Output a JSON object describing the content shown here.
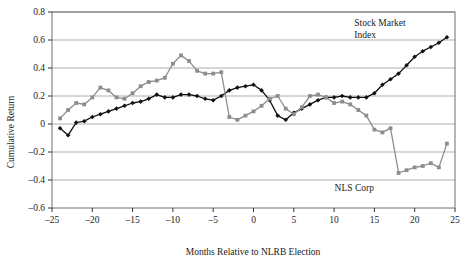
{
  "chart_data": {
    "type": "line",
    "title": "",
    "xlabel": "Months Relative to NLRB Election",
    "ylabel": "Cumulative Return",
    "xlim": [
      -25,
      25
    ],
    "ylim": [
      -0.6,
      0.8
    ],
    "xticks": [
      -25,
      -20,
      -15,
      -10,
      -5,
      0,
      5,
      10,
      15,
      20,
      25
    ],
    "xticklabels": [
      "–25",
      "–20",
      "–15",
      "–10",
      "–5",
      "0",
      "5",
      "10",
      "15",
      "20",
      "25"
    ],
    "yticks": [
      -0.6,
      -0.4,
      -0.2,
      0,
      0.2,
      0.4,
      0.6,
      0.8
    ],
    "yticklabels": [
      "–0.6",
      "–0.4",
      "–0.2",
      "0",
      "0.2",
      "0.4",
      "0.6",
      "0.8"
    ],
    "grid": "horizontal",
    "legend_position": "inline-annotation",
    "series": [
      {
        "name": "Stock Market Index",
        "color": "#111111",
        "marker": "filled-diamond",
        "label_x": 12.5,
        "label_y": 0.7,
        "x": [
          -24,
          -23,
          -22,
          -21,
          -20,
          -19,
          -18,
          -17,
          -16,
          -15,
          -14,
          -13,
          -12,
          -11,
          -10,
          -9,
          -8,
          -7,
          -6,
          -5,
          -4,
          -3,
          -2,
          -1,
          0,
          1,
          2,
          3,
          4,
          5,
          6,
          7,
          8,
          9,
          10,
          11,
          12,
          13,
          14,
          15,
          16,
          17,
          18,
          19,
          20,
          21,
          22,
          23,
          24
        ],
        "values": [
          -0.03,
          -0.08,
          0.01,
          0.02,
          0.05,
          0.07,
          0.09,
          0.11,
          0.13,
          0.15,
          0.16,
          0.18,
          0.21,
          0.19,
          0.19,
          0.21,
          0.21,
          0.2,
          0.18,
          0.17,
          0.2,
          0.24,
          0.26,
          0.27,
          0.28,
          0.24,
          0.17,
          0.06,
          0.03,
          0.08,
          0.11,
          0.14,
          0.17,
          0.19,
          0.19,
          0.2,
          0.19,
          0.19,
          0.19,
          0.22,
          0.28,
          0.32,
          0.36,
          0.42,
          0.48,
          0.52,
          0.55,
          0.58,
          0.62
        ]
      },
      {
        "name": "NLS Corp",
        "color": "#8d8d8d",
        "marker": "filled-square",
        "label_x": 12.5,
        "label_y": -0.48,
        "x": [
          -24,
          -23,
          -22,
          -21,
          -20,
          -19,
          -18,
          -17,
          -16,
          -15,
          -14,
          -13,
          -12,
          -11,
          -10,
          -9,
          -8,
          -7,
          -6,
          -5,
          -4,
          -3,
          -2,
          -1,
          0,
          1,
          2,
          3,
          4,
          5,
          6,
          7,
          8,
          9,
          10,
          11,
          12,
          13,
          14,
          15,
          16,
          17,
          18,
          19,
          20,
          21,
          22,
          23,
          24
        ],
        "values": [
          0.04,
          0.1,
          0.15,
          0.14,
          0.19,
          0.26,
          0.24,
          0.19,
          0.18,
          0.22,
          0.27,
          0.3,
          0.31,
          0.33,
          0.43,
          0.49,
          0.45,
          0.38,
          0.36,
          0.36,
          0.37,
          0.05,
          0.03,
          0.06,
          0.09,
          0.13,
          0.18,
          0.2,
          0.11,
          0.07,
          0.12,
          0.2,
          0.21,
          0.19,
          0.15,
          0.16,
          0.14,
          0.1,
          0.06,
          -0.04,
          -0.06,
          -0.03,
          -0.35,
          -0.33,
          -0.31,
          -0.3,
          -0.28,
          -0.31,
          -0.14
        ]
      }
    ]
  },
  "annotations": {
    "stock_market_index_line1": "Stock Market",
    "stock_market_index_line2": "Index",
    "nls_corp": "NLS Corp"
  }
}
